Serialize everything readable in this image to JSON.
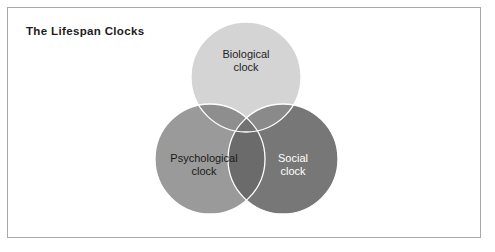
{
  "figure": {
    "title": "The Lifespan Clocks",
    "background_color": "#ffffff",
    "border_color": "#a8a8a8"
  },
  "chart_data": {
    "type": "venn",
    "title": "The Lifespan Clocks",
    "xlabel": "",
    "ylabel": "",
    "legend_position": "none",
    "grid": false,
    "sets": [
      {
        "id": "biological",
        "label_line1": "Biological",
        "label_line2": "clock",
        "label": "Biological clock",
        "position": "top",
        "fill_color": "#d4d4d4",
        "text_color": "#1f1f1f",
        "outline_color": "#ffffff",
        "center_x": 246,
        "center_y": 77,
        "radius": 55
      },
      {
        "id": "psychological",
        "label_line1": "Psychological",
        "label_line2": "clock",
        "label": "Psychological clock",
        "position": "bottom-left",
        "fill_color": "#9a9a9a",
        "text_color": "#1b1b1b",
        "outline_color": "#ffffff",
        "center_x": 210,
        "center_y": 159,
        "radius": 55
      },
      {
        "id": "social",
        "label_line1": "Social",
        "label_line2": "clock",
        "label": "Social clock",
        "position": "bottom-right",
        "fill_color": "#777777",
        "text_color": "#ffffff",
        "outline_color": "#ffffff",
        "center_x": 283,
        "center_y": 159,
        "radius": 55
      }
    ],
    "overlaps": [
      {
        "sets": [
          "biological",
          "psychological"
        ],
        "fill_color": "#8e8e8e"
      },
      {
        "sets": [
          "biological",
          "social"
        ],
        "fill_color": "#8a8a8a"
      },
      {
        "sets": [
          "psychological",
          "social"
        ],
        "fill_color": "#6b6b6b"
      },
      {
        "sets": [
          "biological",
          "psychological",
          "social"
        ],
        "fill_color": "#727272"
      }
    ]
  }
}
